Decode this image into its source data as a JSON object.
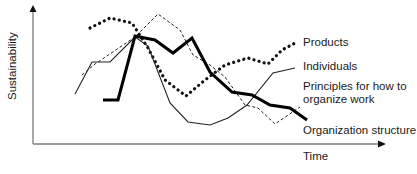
{
  "chart_data": {
    "type": "line",
    "title": "",
    "xlabel": "Time",
    "ylabel": "Sustainability",
    "axes": {
      "ticks": false,
      "grid": false,
      "arrows": true
    },
    "legend_position": "inline-right",
    "series": [
      {
        "name": "Products",
        "style": "heavy-dotted",
        "color": "#111111",
        "points": [
          [
            90,
            28
          ],
          [
            110,
            18
          ],
          [
            132,
            23
          ],
          [
            148,
            48
          ],
          [
            165,
            80
          ],
          [
            186,
            96
          ],
          [
            205,
            80
          ],
          [
            225,
            65
          ],
          [
            248,
            58
          ],
          [
            268,
            64
          ],
          [
            282,
            50
          ],
          [
            297,
            42
          ]
        ]
      },
      {
        "name": "Individuals",
        "style": "thin-solid",
        "color": "#222222",
        "points": [
          [
            75,
            94
          ],
          [
            92,
            62
          ],
          [
            110,
            62
          ],
          [
            135,
            37
          ],
          [
            148,
            46
          ],
          [
            170,
            103
          ],
          [
            188,
            122
          ],
          [
            210,
            125
          ],
          [
            228,
            118
          ],
          [
            247,
            105
          ],
          [
            273,
            73
          ],
          [
            295,
            68
          ]
        ]
      },
      {
        "name": "Principles for how to organize work",
        "style": "thin-dashed",
        "color": "#222222",
        "points": [
          [
            82,
            75
          ],
          [
            95,
            64
          ],
          [
            135,
            37
          ],
          [
            158,
            14
          ],
          [
            180,
            30
          ],
          [
            193,
            55
          ],
          [
            210,
            65
          ],
          [
            225,
            77
          ],
          [
            245,
            105
          ],
          [
            258,
            108
          ],
          [
            275,
            124
          ],
          [
            300,
            107
          ]
        ]
      },
      {
        "name": "Organization structure",
        "style": "thick-solid",
        "color": "#000000",
        "points": [
          [
            103,
            100
          ],
          [
            118,
            100
          ],
          [
            135,
            36
          ],
          [
            155,
            40
          ],
          [
            173,
            53
          ],
          [
            192,
            38
          ],
          [
            210,
            72
          ],
          [
            232,
            92
          ],
          [
            252,
            95
          ],
          [
            270,
            105
          ],
          [
            290,
            108
          ],
          [
            307,
            120
          ]
        ]
      }
    ],
    "annotations": [
      {
        "text": "Products",
        "x": 303,
        "y": 36
      },
      {
        "text": "Individuals",
        "x": 303,
        "y": 60
      },
      {
        "text": "Principles for how to",
        "x": 303,
        "y": 80
      },
      {
        "text": "organize work",
        "x": 303,
        "y": 93
      },
      {
        "text": "Organization structure",
        "x": 303,
        "y": 124
      },
      {
        "text": "Time",
        "x": 347,
        "y": 150
      }
    ]
  },
  "labels": {
    "y_axis": "Sustainability",
    "x_axis": "Time",
    "products": "Products",
    "individuals": "Individuals",
    "principles_line1": "Principles for how to",
    "principles_line2": "organize work",
    "organization": "Organization structure"
  }
}
